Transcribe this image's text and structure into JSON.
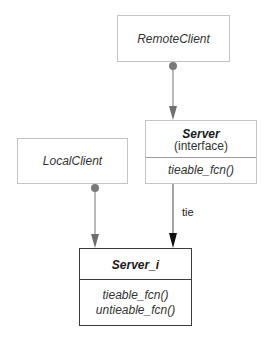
{
  "diagram": {
    "nodes": {
      "remote_client": {
        "name": "RemoteClient"
      },
      "local_client": {
        "name": "LocalClient"
      },
      "server": {
        "name": "Server",
        "stereotype": "(interface)",
        "operations": [
          "tieable_fcn()"
        ]
      },
      "server_i": {
        "name": "Server_i",
        "operations": [
          "tieable_fcn()",
          "untieable_fcn()"
        ]
      }
    },
    "edges": [
      {
        "from": "RemoteClient",
        "to": "Server",
        "label": "",
        "style": "gray-arrow-with-dot"
      },
      {
        "from": "LocalClient",
        "to": "Server_i",
        "label": "",
        "style": "gray-arrow-with-dot"
      },
      {
        "from": "Server",
        "to": "Server_i",
        "label": "tie",
        "style": "black-arrow"
      }
    ],
    "colors": {
      "gray_connector": "#8a8a8a",
      "black_connector": "#111111",
      "light_border": "#c4c4c4",
      "dark_border": "#3a3a3a"
    }
  }
}
